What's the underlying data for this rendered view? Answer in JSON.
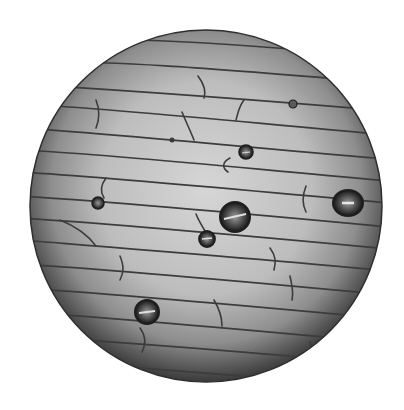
{
  "image": {
    "subject": "onion epidermis cells under microscope",
    "background": "#ffffff",
    "field_of_view": {
      "cx": 206,
      "cy": 206,
      "r": 176
    },
    "colors": {
      "center": "#d4d4d4",
      "mid": "#a9a9a9",
      "edge": "#3a3a3a",
      "cell_wall": "#3c3c3c",
      "bubble_ring": "#1e1e1e"
    },
    "bubbles": [
      {
        "cx": 235,
        "cy": 217,
        "r": 15
      },
      {
        "cx": 348,
        "cy": 203,
        "r": 14
      },
      {
        "cx": 147,
        "cy": 312,
        "r": 12
      },
      {
        "cx": 207,
        "cy": 239,
        "r": 8
      },
      {
        "cx": 246,
        "cy": 152,
        "r": 7
      },
      {
        "cx": 98,
        "cy": 203,
        "r": 6
      },
      {
        "cx": 293,
        "cy": 104,
        "r": 4
      },
      {
        "cx": 172,
        "cy": 140,
        "r": 3
      }
    ]
  }
}
